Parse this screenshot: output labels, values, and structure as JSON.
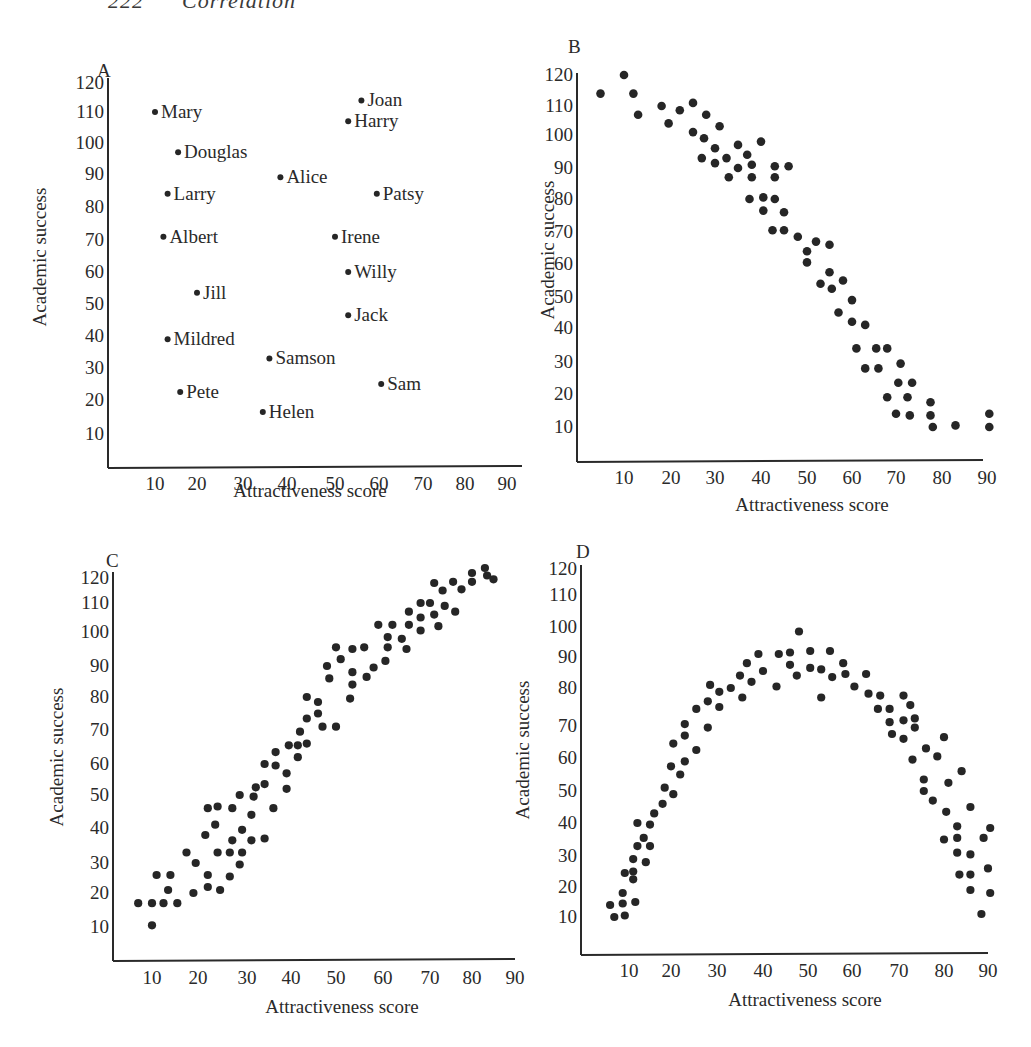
{
  "page": {
    "page_number": "222",
    "running_title": "Correlation"
  },
  "chart_data": [
    {
      "id": "A",
      "panel_label": "A",
      "type": "scatter",
      "title": "",
      "xlabel": "Attractiveness score",
      "ylabel": "Academic success",
      "xlim": [
        0,
        90
      ],
      "ylim": [
        0,
        120
      ],
      "xticks": [
        10,
        20,
        30,
        40,
        50,
        60,
        70,
        80,
        90
      ],
      "yticks": [
        10,
        20,
        30,
        40,
        50,
        60,
        70,
        80,
        90,
        100,
        110,
        120
      ],
      "grid": false,
      "points": [
        {
          "label": "Mary",
          "x": 10,
          "y": 110
        },
        {
          "label": "Joan",
          "x": 56,
          "y": 114
        },
        {
          "label": "Harry",
          "x": 53,
          "y": 107
        },
        {
          "label": "Douglas",
          "x": 15.5,
          "y": 97
        },
        {
          "label": "Alice",
          "x": 38.5,
          "y": 89
        },
        {
          "label": "Larry",
          "x": 13,
          "y": 84
        },
        {
          "label": "Patsy",
          "x": 59.5,
          "y": 84
        },
        {
          "label": "Albert",
          "x": 12,
          "y": 71
        },
        {
          "label": "Irene",
          "x": 50,
          "y": 71
        },
        {
          "label": "Willy",
          "x": 53,
          "y": 60
        },
        {
          "label": "Jill",
          "x": 20,
          "y": 53.5
        },
        {
          "label": "Jack",
          "x": 53,
          "y": 46.5
        },
        {
          "label": "Mildred",
          "x": 13,
          "y": 39
        },
        {
          "label": "Samson",
          "x": 36,
          "y": 33
        },
        {
          "label": "Sam",
          "x": 60.5,
          "y": 25
        },
        {
          "label": "Pete",
          "x": 16,
          "y": 22.5
        },
        {
          "label": "Helen",
          "x": 34.5,
          "y": 16.5
        }
      ]
    },
    {
      "id": "B",
      "panel_label": "B",
      "type": "scatter",
      "title": "",
      "xlabel": "Attractiveness score",
      "ylabel": "Academic success",
      "xlim": [
        0,
        90
      ],
      "ylim": [
        0,
        120
      ],
      "xticks": [
        10,
        20,
        30,
        40,
        50,
        60,
        70,
        80,
        90
      ],
      "yticks": [
        10,
        20,
        30,
        40,
        50,
        60,
        70,
        80,
        90,
        100,
        110,
        120
      ],
      "grid": false,
      "points": [
        {
          "x": 5,
          "y": 114
        },
        {
          "x": 10,
          "y": 120
        },
        {
          "x": 12,
          "y": 114
        },
        {
          "x": 13,
          "y": 107
        },
        {
          "x": 18,
          "y": 110
        },
        {
          "x": 19.5,
          "y": 104
        },
        {
          "x": 22,
          "y": 108.5
        },
        {
          "x": 25,
          "y": 111
        },
        {
          "x": 25,
          "y": 101
        },
        {
          "x": 28,
          "y": 107
        },
        {
          "x": 27.5,
          "y": 99
        },
        {
          "x": 31,
          "y": 103
        },
        {
          "x": 27,
          "y": 93
        },
        {
          "x": 30,
          "y": 96
        },
        {
          "x": 30,
          "y": 91.5
        },
        {
          "x": 32.5,
          "y": 93
        },
        {
          "x": 33,
          "y": 87
        },
        {
          "x": 35,
          "y": 97
        },
        {
          "x": 35,
          "y": 90
        },
        {
          "x": 37,
          "y": 94
        },
        {
          "x": 38,
          "y": 91
        },
        {
          "x": 38,
          "y": 87
        },
        {
          "x": 40,
          "y": 98
        },
        {
          "x": 43,
          "y": 90.5
        },
        {
          "x": 43,
          "y": 87
        },
        {
          "x": 46,
          "y": 90.5
        },
        {
          "x": 37.5,
          "y": 80
        },
        {
          "x": 40.5,
          "y": 80.5
        },
        {
          "x": 43,
          "y": 80
        },
        {
          "x": 40.5,
          "y": 76.5
        },
        {
          "x": 45,
          "y": 76
        },
        {
          "x": 42.5,
          "y": 70.5
        },
        {
          "x": 45,
          "y": 70.5
        },
        {
          "x": 48,
          "y": 68.5
        },
        {
          "x": 52,
          "y": 67
        },
        {
          "x": 55,
          "y": 66
        },
        {
          "x": 50,
          "y": 64
        },
        {
          "x": 50,
          "y": 60.5
        },
        {
          "x": 55,
          "y": 57.5
        },
        {
          "x": 53,
          "y": 54
        },
        {
          "x": 55.5,
          "y": 52.5
        },
        {
          "x": 58,
          "y": 55
        },
        {
          "x": 60,
          "y": 49
        },
        {
          "x": 57,
          "y": 45
        },
        {
          "x": 60,
          "y": 42
        },
        {
          "x": 63,
          "y": 41
        },
        {
          "x": 61,
          "y": 34
        },
        {
          "x": 65.5,
          "y": 34
        },
        {
          "x": 68,
          "y": 34
        },
        {
          "x": 63,
          "y": 28
        },
        {
          "x": 66,
          "y": 28
        },
        {
          "x": 71,
          "y": 29.5
        },
        {
          "x": 70.5,
          "y": 23.5
        },
        {
          "x": 73.5,
          "y": 23.5
        },
        {
          "x": 68,
          "y": 19
        },
        {
          "x": 72.5,
          "y": 19
        },
        {
          "x": 70,
          "y": 14
        },
        {
          "x": 73,
          "y": 13.5
        },
        {
          "x": 77.5,
          "y": 17.5
        },
        {
          "x": 77.5,
          "y": 13.5
        },
        {
          "x": 78,
          "y": 10
        },
        {
          "x": 83,
          "y": 10.5
        },
        {
          "x": 90.5,
          "y": 14
        },
        {
          "x": 90.5,
          "y": 10
        }
      ]
    },
    {
      "id": "C",
      "panel_label": "C",
      "type": "scatter",
      "title": "",
      "xlabel": "Attractiveness score",
      "ylabel": "Academic success",
      "xlim": [
        0,
        90
      ],
      "ylim": [
        0,
        120
      ],
      "xticks": [
        10,
        20,
        30,
        40,
        50,
        60,
        70,
        80,
        90
      ],
      "yticks": [
        10,
        20,
        30,
        40,
        50,
        60,
        70,
        80,
        90,
        100,
        110,
        120
      ],
      "grid": false,
      "points": [
        {
          "x": 83,
          "y": 124
        },
        {
          "x": 80,
          "y": 122
        },
        {
          "x": 83.5,
          "y": 121
        },
        {
          "x": 85,
          "y": 119.5
        },
        {
          "x": 80,
          "y": 118.5
        },
        {
          "x": 75.5,
          "y": 118.5
        },
        {
          "x": 71,
          "y": 118
        },
        {
          "x": 77.5,
          "y": 115.5
        },
        {
          "x": 73,
          "y": 115
        },
        {
          "x": 68,
          "y": 110
        },
        {
          "x": 70,
          "y": 110
        },
        {
          "x": 73.5,
          "y": 109
        },
        {
          "x": 65.5,
          "y": 107
        },
        {
          "x": 76,
          "y": 107
        },
        {
          "x": 68,
          "y": 105
        },
        {
          "x": 71,
          "y": 106
        },
        {
          "x": 59,
          "y": 102.5
        },
        {
          "x": 62,
          "y": 102.5
        },
        {
          "x": 65.5,
          "y": 102.5
        },
        {
          "x": 72,
          "y": 102
        },
        {
          "x": 68,
          "y": 100.5
        },
        {
          "x": 61,
          "y": 98.5
        },
        {
          "x": 64,
          "y": 98
        },
        {
          "x": 61,
          "y": 95.5
        },
        {
          "x": 65,
          "y": 95
        },
        {
          "x": 50,
          "y": 95.5
        },
        {
          "x": 53.5,
          "y": 95
        },
        {
          "x": 56,
          "y": 95.5
        },
        {
          "x": 51,
          "y": 92
        },
        {
          "x": 60.5,
          "y": 91.5
        },
        {
          "x": 48,
          "y": 90
        },
        {
          "x": 58,
          "y": 89.5
        },
        {
          "x": 53.5,
          "y": 88
        },
        {
          "x": 48.5,
          "y": 86
        },
        {
          "x": 56.5,
          "y": 86.5
        },
        {
          "x": 53.5,
          "y": 84
        },
        {
          "x": 43.5,
          "y": 80
        },
        {
          "x": 46,
          "y": 78.5
        },
        {
          "x": 53,
          "y": 79.5
        },
        {
          "x": 46,
          "y": 75
        },
        {
          "x": 43.5,
          "y": 73.5
        },
        {
          "x": 47,
          "y": 71
        },
        {
          "x": 50,
          "y": 71
        },
        {
          "x": 42,
          "y": 69.5
        },
        {
          "x": 39.5,
          "y": 65.5
        },
        {
          "x": 41.5,
          "y": 65.5
        },
        {
          "x": 43.5,
          "y": 66
        },
        {
          "x": 36.5,
          "y": 63.5
        },
        {
          "x": 41.5,
          "y": 62
        },
        {
          "x": 34,
          "y": 60
        },
        {
          "x": 36.5,
          "y": 59.5
        },
        {
          "x": 39,
          "y": 57
        },
        {
          "x": 34,
          "y": 53.5
        },
        {
          "x": 39,
          "y": 52
        },
        {
          "x": 32,
          "y": 52.5
        },
        {
          "x": 28.5,
          "y": 50
        },
        {
          "x": 31.5,
          "y": 49.5
        },
        {
          "x": 22,
          "y": 46
        },
        {
          "x": 24,
          "y": 46.5
        },
        {
          "x": 27,
          "y": 46
        },
        {
          "x": 36,
          "y": 46
        },
        {
          "x": 31,
          "y": 44
        },
        {
          "x": 23.5,
          "y": 41
        },
        {
          "x": 29,
          "y": 39.5
        },
        {
          "x": 21.5,
          "y": 38
        },
        {
          "x": 27,
          "y": 36.5
        },
        {
          "x": 31,
          "y": 36.5
        },
        {
          "x": 34,
          "y": 37
        },
        {
          "x": 17.5,
          "y": 33
        },
        {
          "x": 24,
          "y": 33
        },
        {
          "x": 26.5,
          "y": 33
        },
        {
          "x": 29,
          "y": 33
        },
        {
          "x": 19.5,
          "y": 30
        },
        {
          "x": 28.5,
          "y": 29.5
        },
        {
          "x": 11,
          "y": 26
        },
        {
          "x": 14,
          "y": 26
        },
        {
          "x": 22,
          "y": 26
        },
        {
          "x": 26.5,
          "y": 25.5
        },
        {
          "x": 13.5,
          "y": 21
        },
        {
          "x": 22,
          "y": 22
        },
        {
          "x": 24.5,
          "y": 21
        },
        {
          "x": 19,
          "y": 20
        },
        {
          "x": 7,
          "y": 17
        },
        {
          "x": 10,
          "y": 17
        },
        {
          "x": 12.5,
          "y": 17
        },
        {
          "x": 15.5,
          "y": 17
        },
        {
          "x": 10,
          "y": 10.5
        }
      ]
    },
    {
      "id": "D",
      "panel_label": "D",
      "type": "scatter",
      "title": "",
      "xlabel": "Attractiveness score",
      "ylabel": "Academic success",
      "xlim": [
        0,
        90
      ],
      "ylim": [
        0,
        120
      ],
      "xticks": [
        10,
        20,
        30,
        40,
        50,
        60,
        70,
        80,
        90
      ],
      "yticks": [
        10,
        20,
        30,
        40,
        50,
        60,
        70,
        80,
        90,
        100,
        110,
        120
      ],
      "grid": false,
      "points": [
        {
          "x": 48,
          "y": 98.5
        },
        {
          "x": 43.5,
          "y": 91
        },
        {
          "x": 46,
          "y": 91.5
        },
        {
          "x": 39,
          "y": 91
        },
        {
          "x": 50.5,
          "y": 92
        },
        {
          "x": 55,
          "y": 92
        },
        {
          "x": 36.5,
          "y": 88
        },
        {
          "x": 46,
          "y": 87.5
        },
        {
          "x": 50.5,
          "y": 86.5
        },
        {
          "x": 53,
          "y": 86
        },
        {
          "x": 58,
          "y": 88
        },
        {
          "x": 40,
          "y": 85.5
        },
        {
          "x": 35,
          "y": 84
        },
        {
          "x": 47.5,
          "y": 84
        },
        {
          "x": 55.5,
          "y": 83.5
        },
        {
          "x": 58.5,
          "y": 84.5
        },
        {
          "x": 63,
          "y": 84.5
        },
        {
          "x": 37.5,
          "y": 82
        },
        {
          "x": 28.5,
          "y": 81
        },
        {
          "x": 43,
          "y": 80.5
        },
        {
          "x": 60.5,
          "y": 80.5
        },
        {
          "x": 33,
          "y": 80
        },
        {
          "x": 30.5,
          "y": 79
        },
        {
          "x": 53,
          "y": 77.5
        },
        {
          "x": 35.5,
          "y": 77.5
        },
        {
          "x": 63.5,
          "y": 78.5
        },
        {
          "x": 66,
          "y": 78
        },
        {
          "x": 71,
          "y": 78
        },
        {
          "x": 28,
          "y": 76.5
        },
        {
          "x": 25.5,
          "y": 74.5
        },
        {
          "x": 30.5,
          "y": 75
        },
        {
          "x": 72.5,
          "y": 75.5
        },
        {
          "x": 65.5,
          "y": 74.5
        },
        {
          "x": 68,
          "y": 74.5
        },
        {
          "x": 73.5,
          "y": 72
        },
        {
          "x": 71,
          "y": 71.5
        },
        {
          "x": 68,
          "y": 71
        },
        {
          "x": 23,
          "y": 70.5
        },
        {
          "x": 73.5,
          "y": 69.5
        },
        {
          "x": 28,
          "y": 69.5
        },
        {
          "x": 68.5,
          "y": 67.5
        },
        {
          "x": 23,
          "y": 67
        },
        {
          "x": 71,
          "y": 66
        },
        {
          "x": 80,
          "y": 66.5
        },
        {
          "x": 20.5,
          "y": 64.5
        },
        {
          "x": 76,
          "y": 63
        },
        {
          "x": 25.5,
          "y": 62.5
        },
        {
          "x": 78.5,
          "y": 60.5
        },
        {
          "x": 73,
          "y": 59.5
        },
        {
          "x": 23,
          "y": 59
        },
        {
          "x": 20,
          "y": 57.5
        },
        {
          "x": 84,
          "y": 56
        },
        {
          "x": 22,
          "y": 55
        },
        {
          "x": 75.5,
          "y": 53.5
        },
        {
          "x": 81,
          "y": 52.5
        },
        {
          "x": 18.5,
          "y": 51
        },
        {
          "x": 75.5,
          "y": 50
        },
        {
          "x": 20.5,
          "y": 49
        },
        {
          "x": 77.5,
          "y": 47
        },
        {
          "x": 18,
          "y": 46
        },
        {
          "x": 86,
          "y": 45
        },
        {
          "x": 16,
          "y": 43
        },
        {
          "x": 80.5,
          "y": 43.5
        },
        {
          "x": 12,
          "y": 40
        },
        {
          "x": 15,
          "y": 39.5
        },
        {
          "x": 83,
          "y": 39
        },
        {
          "x": 90.5,
          "y": 38.5
        },
        {
          "x": 13.5,
          "y": 35.5
        },
        {
          "x": 80,
          "y": 35
        },
        {
          "x": 83,
          "y": 35.5
        },
        {
          "x": 89,
          "y": 35.5
        },
        {
          "x": 12,
          "y": 33
        },
        {
          "x": 15,
          "y": 33
        },
        {
          "x": 11,
          "y": 29
        },
        {
          "x": 83,
          "y": 31
        },
        {
          "x": 86,
          "y": 30.5
        },
        {
          "x": 14,
          "y": 28
        },
        {
          "x": 9,
          "y": 24.5
        },
        {
          "x": 11,
          "y": 25
        },
        {
          "x": 90,
          "y": 26
        },
        {
          "x": 83.5,
          "y": 24
        },
        {
          "x": 86,
          "y": 24
        },
        {
          "x": 11,
          "y": 22.5
        },
        {
          "x": 86,
          "y": 19
        },
        {
          "x": 90.5,
          "y": 18
        },
        {
          "x": 8.5,
          "y": 18
        },
        {
          "x": 11.5,
          "y": 15
        },
        {
          "x": 5.5,
          "y": 14
        },
        {
          "x": 8.5,
          "y": 14.5
        },
        {
          "x": 9,
          "y": 10.5
        },
        {
          "x": 6.5,
          "y": 10
        },
        {
          "x": 88.5,
          "y": 11
        }
      ]
    }
  ]
}
